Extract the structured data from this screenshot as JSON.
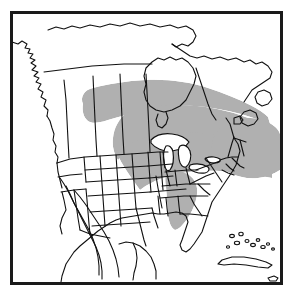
{
  "figure": {
    "kind": "distribution-range-map",
    "title": "",
    "caption": "",
    "region": "North America",
    "projection_note": "conic, continental North America with Canada, United States, Mexico, Cuba and the Bahamas"
  },
  "frame": {
    "visible": true,
    "border_color": "#1a1a1a",
    "border_width_px": 3,
    "x": 10,
    "y": 11,
    "width": 273,
    "height": 274
  },
  "colors": {
    "background": "#ffffff",
    "coastline": "#111111",
    "boundary": "#111111",
    "range_fill": "#b0b0b0",
    "range_stroke": "none",
    "lake_fill": "#ffffff"
  },
  "legend": {
    "visible": false,
    "entries": [
      {
        "swatch": "#b0b0b0",
        "label": "breeding / distribution range"
      }
    ]
  },
  "range_shading": {
    "label": "shaded distribution range",
    "fill": "#b0b0b0",
    "description": "Broad band running from the southern Canadian prairies (Alberta / Saskatchewan) east-southeast across Manitoba and Ontario, south of Hudson Bay, covering the Great Lakes states, southern Ontario and Quebec, New England and the Maritimes; a narrow southern lobe extends down the Appalachians into Tennessee and northern Alabama. Great Lakes water bodies are left unshaded.",
    "lobes": [
      "prairie-band",
      "great-lakes",
      "northeast-maritimes",
      "appalachian-lobe"
    ]
  },
  "labels": {
    "items": []
  },
  "annotations": {
    "items": []
  }
}
